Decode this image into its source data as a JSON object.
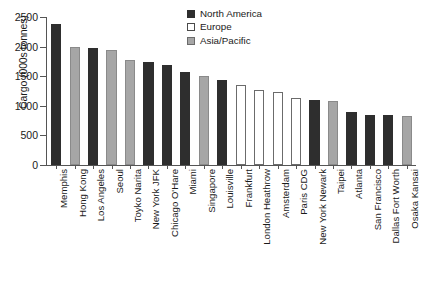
{
  "chart_data": {
    "type": "bar",
    "title": "",
    "xlabel": "",
    "ylabel": "Cargo (000s tonnes)",
    "ylim": [
      0,
      2500
    ],
    "yticks": [
      0,
      500,
      1000,
      1500,
      2000,
      2500
    ],
    "ytick_labels": [
      "0",
      "500",
      "1000",
      "1500",
      "2000",
      "2500"
    ],
    "grid": false,
    "legend_position": "top-center-right",
    "legend": [
      {
        "name": "North America",
        "key": "na",
        "color": "#2e2e2e"
      },
      {
        "name": "Europe",
        "key": "eu",
        "color": "#ffffff"
      },
      {
        "name": "Asia/Pacific",
        "key": "ap",
        "color": "#a6a6a6"
      }
    ],
    "categories": [
      "Memphis",
      "Hong Kong",
      "Los Angeles",
      "Seoul",
      "Toyko Narita",
      "New York JFK",
      "Chicago O'Hare",
      "Miami",
      "Singapore",
      "Louisville",
      "Frankfurt",
      "London Heathrow",
      "Amsterdam",
      "Paris CDG",
      "New York Newark",
      "Taipei",
      "Atlanta",
      "San Francisco",
      "Dallas Fort Worth",
      "Osaka Kansai"
    ],
    "values": [
      2380,
      1990,
      1970,
      1950,
      1780,
      1740,
      1695,
      1570,
      1500,
      1440,
      1350,
      1270,
      1230,
      1130,
      1100,
      1080,
      890,
      850,
      840,
      825
    ],
    "series_keys": [
      "na",
      "ap",
      "na",
      "ap",
      "ap",
      "na",
      "na",
      "na",
      "ap",
      "na",
      "eu",
      "eu",
      "eu",
      "eu",
      "na",
      "ap",
      "na",
      "na",
      "na",
      "ap"
    ]
  },
  "caption": ""
}
